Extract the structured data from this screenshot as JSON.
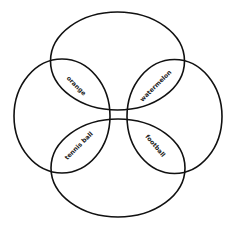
{
  "diagram": {
    "type": "venn-four-ellipse",
    "stroke_color": "#111111",
    "background": "#ffffff",
    "sets": [
      {
        "name": "top",
        "label": ""
      },
      {
        "name": "left",
        "label": ""
      },
      {
        "name": "right",
        "label": ""
      },
      {
        "name": "bottom",
        "label": ""
      }
    ],
    "regions": {
      "top_left": {
        "label": "orange"
      },
      "top_right": {
        "label": "watermelon"
      },
      "bottom_left": {
        "label": "tennis ball"
      },
      "bottom_right": {
        "label": "football"
      }
    }
  }
}
